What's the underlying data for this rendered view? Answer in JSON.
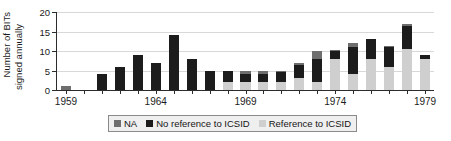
{
  "chart_data": {
    "type": "bar",
    "stacked": true,
    "title": "",
    "subtitle": "",
    "xlabel": "",
    "ylabel": "Number of BITs signed annually",
    "ylabel_lines": [
      "Number of BITs",
      "signed annually"
    ],
    "ylim": [
      0,
      20
    ],
    "yticks": [
      0,
      5,
      10,
      15,
      20
    ],
    "ytick_labels": [
      "0",
      "5",
      "10",
      "15",
      "20"
    ],
    "grid": true,
    "grid_axis": "y",
    "legend_position": "bottom",
    "x": [
      1959,
      1960,
      1961,
      1962,
      1963,
      1964,
      1965,
      1966,
      1967,
      1968,
      1969,
      1970,
      1971,
      1972,
      1973,
      1974,
      1975,
      1976,
      1977,
      1978,
      1979
    ],
    "xtick_labels": [
      "1959",
      "1964",
      "1969",
      "1974",
      "1979"
    ],
    "xticks": [
      1959,
      1964,
      1969,
      1974,
      1979
    ],
    "series": [
      {
        "name": "Reference to ICSID",
        "color": "#cfcfcf",
        "values": [
          0,
          0,
          0,
          0,
          0,
          0,
          0,
          0,
          0,
          2,
          2,
          2,
          2,
          3,
          2,
          8,
          4,
          8,
          6,
          10.5,
          8
        ]
      },
      {
        "name": "No reference to ICSID",
        "color": "#1c1c1c",
        "values": [
          0,
          0,
          4,
          6,
          9,
          7,
          14,
          8,
          5,
          3,
          2,
          2,
          2.5,
          3.5,
          6,
          2,
          7,
          5,
          5,
          6,
          1
        ]
      },
      {
        "name": "NA",
        "color": "#6e6e6e",
        "values": [
          1,
          0,
          0,
          0,
          0,
          0,
          0,
          0,
          0,
          0,
          1,
          1,
          0.5,
          0.5,
          2,
          0.2,
          1,
          0,
          0.2,
          0.5,
          0
        ]
      }
    ],
    "totals": [
      1,
      0,
      4,
      6,
      9,
      7,
      14,
      8,
      5,
      5,
      5,
      5,
      5,
      7,
      10,
      10.2,
      12,
      13,
      11.2,
      17,
      9
    ]
  },
  "legend": {
    "items": [
      {
        "label": "NA",
        "color": "#6e6e6e"
      },
      {
        "label": "No reference to ICSID",
        "color": "#1c1c1c"
      },
      {
        "label": "Reference to ICSID",
        "color": "#cfcfcf"
      }
    ]
  }
}
